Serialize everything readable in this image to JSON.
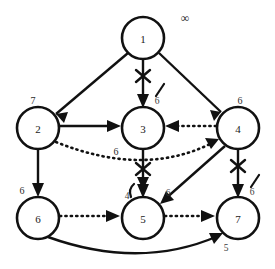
{
  "diagram": {
    "background_color": "#ffffff",
    "stroke_color": "#111111",
    "nodes": [
      {
        "id": "n1",
        "label": "1",
        "cx": 143,
        "cy": 38,
        "r": 21,
        "dist_label": "∞",
        "dist_x": 185,
        "dist_y": 18
      },
      {
        "id": "n2",
        "label": "2",
        "cx": 38,
        "cy": 128,
        "r": 21,
        "dist_label": "7",
        "dist_x": 33,
        "dist_y": 100
      },
      {
        "id": "n3",
        "label": "3",
        "cx": 143,
        "cy": 128,
        "r": 21,
        "dist_label": "6",
        "dist_x": 116,
        "dist_y": 151
      },
      {
        "id": "n4",
        "label": "4",
        "cx": 238,
        "cy": 128,
        "r": 21,
        "dist_label": "6",
        "dist_x": 240,
        "dist_y": 100
      },
      {
        "id": "n6",
        "label": "6",
        "cx": 38,
        "cy": 218,
        "r": 21,
        "dist_label": "6",
        "dist_x": 22,
        "dist_y": 190
      },
      {
        "id": "n5",
        "label": "5",
        "cx": 143,
        "cy": 218,
        "r": 21,
        "dist_label": "6",
        "dist_x": 160,
        "dist_y": 192
      },
      {
        "id": "n7",
        "label": "7",
        "cx": 238,
        "cy": 218,
        "r": 21,
        "dist_label": "6",
        "dist_x": 256,
        "dist_y": 192
      }
    ],
    "edges": [
      {
        "id": "e1_2",
        "from": "1",
        "to": "2",
        "style": "solid",
        "crossed": false,
        "weight": ""
      },
      {
        "id": "e1_3",
        "from": "1",
        "to": "3",
        "style": "solid",
        "crossed": true,
        "weight": "6"
      },
      {
        "id": "e1_4",
        "from": "1",
        "to": "4",
        "style": "solid",
        "crossed": false,
        "weight": ""
      },
      {
        "id": "e2_3",
        "from": "2",
        "to": "3",
        "style": "solid",
        "crossed": false,
        "weight": ""
      },
      {
        "id": "e2_6",
        "from": "2",
        "to": "6",
        "style": "solid",
        "crossed": false,
        "weight": ""
      },
      {
        "id": "e2_4",
        "from": "2",
        "to": "4",
        "style": "dotted",
        "crossed": false,
        "weight": ""
      },
      {
        "id": "e4_3",
        "from": "4",
        "to": "3",
        "style": "dotted",
        "crossed": false,
        "weight": ""
      },
      {
        "id": "e4_5",
        "from": "4",
        "to": "5",
        "style": "solid",
        "crossed": false,
        "weight": ""
      },
      {
        "id": "e4_7",
        "from": "4",
        "to": "7",
        "style": "solid",
        "crossed": true,
        "weight": "6"
      },
      {
        "id": "e3_5",
        "from": "3",
        "to": "5",
        "style": "solid",
        "crossed": true,
        "weight": "4"
      },
      {
        "id": "e6_5",
        "from": "6",
        "to": "5",
        "style": "dotted",
        "crossed": false,
        "weight": ""
      },
      {
        "id": "e5_7",
        "from": "5",
        "to": "7",
        "style": "dotted",
        "crossed": false,
        "weight": ""
      },
      {
        "id": "e6_7",
        "from": "6",
        "to": "7",
        "style": "solid",
        "crossed": false,
        "weight": "5"
      }
    ],
    "edge_weight_labels": [
      {
        "id": "w_6_7",
        "text": "5",
        "x": 226,
        "y": 248
      },
      {
        "id": "w_4_5",
        "text": "6",
        "x": 168,
        "y": 193
      }
    ]
  }
}
